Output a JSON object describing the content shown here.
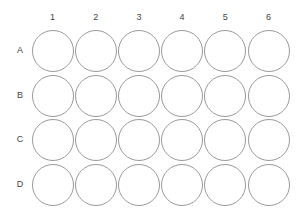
{
  "plate": {
    "type": "24-well plate",
    "columns": [
      "1",
      "2",
      "3",
      "4",
      "5",
      "6"
    ],
    "rows": [
      "A",
      "B",
      "C",
      "D"
    ],
    "well_border_color": "#9a9a9a",
    "label_color": "#444444"
  }
}
